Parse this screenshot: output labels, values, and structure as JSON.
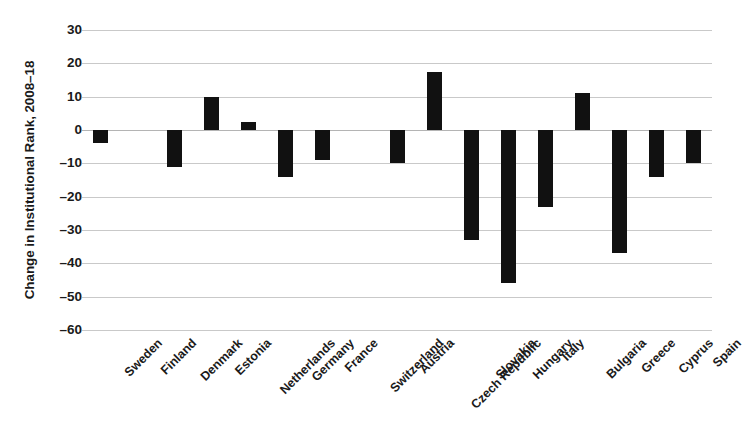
{
  "chart_data": {
    "type": "bar",
    "title": "",
    "xlabel": "",
    "ylabel": "Change in Institutional Rank, 2008–18",
    "ylim": [
      -60,
      30
    ],
    "ytick_step": 10,
    "grid": true,
    "legend": "none",
    "bar_color": "#111111",
    "gridline_color": "#c9c9c9",
    "categories": [
      "Sweden",
      "Finland",
      "Denmark",
      "Estonia",
      "Netherlands",
      "Germany",
      "France",
      "Switzerland",
      "Austria",
      "Czech Republic",
      "Slovakia",
      "Hungary",
      "Italy",
      "Bulgaria",
      "Greece",
      "Cyprus",
      "Spain"
    ],
    "values": [
      -4,
      0,
      -11,
      10,
      2.5,
      -14,
      -9,
      0,
      -10,
      17.5,
      -33,
      -46,
      -23,
      11,
      -37,
      -14,
      -10
    ],
    "yticks": [
      30,
      20,
      10,
      0,
      -10,
      -20,
      -30,
      -40,
      -50,
      -60
    ],
    "ytick_labels": [
      "30",
      "20",
      "10",
      "0",
      "–10",
      "–20",
      "–30",
      "–40",
      "–50",
      "–60"
    ]
  }
}
